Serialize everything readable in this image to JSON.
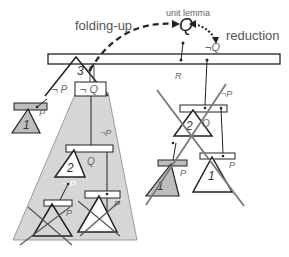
{
  "labels": {
    "folding_up": "folding-up",
    "unit_lemma": "unit lemma",
    "q_symbol": "Q",
    "reduction": "reduction",
    "not_q_top": "¬Q",
    "r_label": "R",
    "node3": "3",
    "not_p_left": "¬ P",
    "not_q_box": "¬ Q",
    "left_p": "P",
    "left_node1": "1",
    "not_p_mid": "¬P",
    "node2_left": "2",
    "q_left": "Q",
    "not_p_lower": "¬ P",
    "p_bottom_left": "P",
    "p_bottom_right": "P",
    "right_not_p": "¬P",
    "right_node2": "2",
    "right_q": "Q",
    "right_p_a": "P",
    "right_node1_a": "1",
    "right_p_b": "P",
    "right_node1_b": "1"
  },
  "colors": {
    "shade": "#d6d6d6",
    "line": "#222222",
    "cross": "#7a7a7a",
    "text": "#555555"
  }
}
